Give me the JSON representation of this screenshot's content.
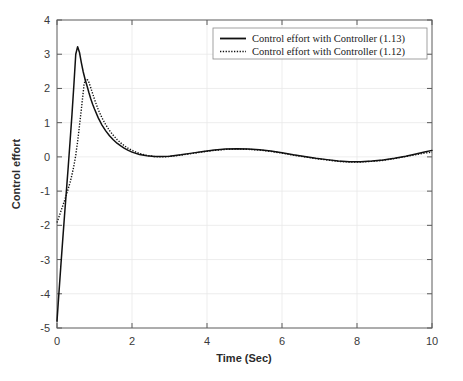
{
  "chart_data": {
    "type": "line",
    "title": "",
    "xlabel": "Time (Sec)",
    "ylabel": "Control effort",
    "xlim": [
      0,
      10
    ],
    "ylim": [
      -5,
      4
    ],
    "xticks": [
      0,
      2,
      4,
      6,
      8,
      10
    ],
    "yticks": [
      -5,
      -4,
      -3,
      -2,
      -1,
      0,
      1,
      2,
      3,
      4
    ],
    "xtick_labels": [
      "0",
      "2",
      "4",
      "6",
      "8",
      "10"
    ],
    "ytick_labels": [
      "-5",
      "-4",
      "-3",
      "-2",
      "-1",
      "0",
      "1",
      "2",
      "3",
      "4"
    ],
    "grid": true,
    "legend_position": "top-right",
    "series": [
      {
        "name": "Control effort with Controller (1.13)",
        "style": "solid",
        "color": "#111111",
        "x": [
          0.0,
          0.05,
          0.1,
          0.15,
          0.2,
          0.25,
          0.3,
          0.35,
          0.4,
          0.45,
          0.5,
          0.55,
          0.6,
          0.65,
          0.7,
          0.75,
          0.8,
          0.85,
          0.9,
          0.95,
          1.0,
          1.1,
          1.2,
          1.3,
          1.4,
          1.5,
          1.6,
          1.7,
          1.8,
          1.9,
          2.0,
          2.2,
          2.4,
          2.6,
          2.8,
          3.0,
          3.3,
          3.6,
          3.9,
          4.2,
          4.5,
          4.8,
          5.1,
          5.4,
          5.7,
          6.0,
          6.3,
          6.6,
          6.9,
          7.2,
          7.5,
          7.8,
          8.1,
          8.4,
          8.7,
          9.0,
          9.3,
          9.6,
          9.8,
          10.0
        ],
        "y": [
          -4.8,
          -4.0,
          -3.22,
          -2.46,
          -1.72,
          -1.0,
          -0.28,
          0.48,
          1.25,
          2.1,
          3.0,
          3.22,
          3.05,
          2.75,
          2.48,
          2.26,
          2.08,
          1.88,
          1.7,
          1.54,
          1.4,
          1.14,
          0.93,
          0.76,
          0.62,
          0.5,
          0.4,
          0.32,
          0.25,
          0.19,
          0.14,
          0.07,
          0.03,
          0.01,
          0.01,
          0.02,
          0.06,
          0.11,
          0.16,
          0.2,
          0.23,
          0.24,
          0.23,
          0.21,
          0.17,
          0.12,
          0.06,
          0.01,
          -0.04,
          -0.08,
          -0.12,
          -0.14,
          -0.14,
          -0.12,
          -0.09,
          -0.04,
          0.02,
          0.09,
          0.14,
          0.19
        ]
      },
      {
        "name": "Control effort with Controller (1.12)",
        "style": "dotted",
        "color": "#111111",
        "x": [
          0.0,
          0.05,
          0.1,
          0.15,
          0.2,
          0.25,
          0.3,
          0.35,
          0.4,
          0.45,
          0.5,
          0.55,
          0.6,
          0.65,
          0.7,
          0.72,
          0.75,
          0.8,
          0.85,
          0.9,
          0.95,
          1.0,
          1.1,
          1.2,
          1.3,
          1.4,
          1.5,
          1.6,
          1.7,
          1.8,
          1.9,
          2.0,
          2.2,
          2.4,
          2.6,
          2.8,
          3.0,
          3.3,
          3.6,
          3.9,
          4.2,
          4.5,
          4.8,
          5.1,
          5.4,
          5.7,
          6.0,
          6.3,
          6.6,
          6.9,
          7.2,
          7.5,
          7.8,
          8.1,
          8.4,
          8.7,
          9.0,
          9.3,
          9.6,
          9.8,
          10.0
        ],
        "y": [
          -1.92,
          -1.76,
          -1.6,
          -1.44,
          -1.28,
          -1.11,
          -0.93,
          -0.74,
          -0.52,
          -0.26,
          0.05,
          0.45,
          0.92,
          1.4,
          1.9,
          2.1,
          2.24,
          2.28,
          2.18,
          2.02,
          1.85,
          1.68,
          1.38,
          1.14,
          0.94,
          0.77,
          0.63,
          0.51,
          0.41,
          0.32,
          0.25,
          0.19,
          0.1,
          0.04,
          0.01,
          0.0,
          0.01,
          0.05,
          0.1,
          0.15,
          0.19,
          0.22,
          0.23,
          0.22,
          0.2,
          0.16,
          0.11,
          0.05,
          0.0,
          -0.05,
          -0.09,
          -0.13,
          -0.15,
          -0.15,
          -0.13,
          -0.1,
          -0.05,
          0.01,
          0.07,
          0.11,
          0.14
        ]
      }
    ]
  },
  "axes": {
    "xlabel": "Time (Sec)",
    "ylabel": "Control effort"
  },
  "legend": {
    "entries": [
      {
        "label": "Control effort with Controller (1.13)",
        "style": "solid"
      },
      {
        "label": "Control effort with Controller (1.12)",
        "style": "dotted"
      }
    ]
  },
  "colors": {
    "line": "#111111",
    "axis": "#5a5a5a",
    "grid": "#e8e8e8",
    "background": "#ffffff"
  }
}
